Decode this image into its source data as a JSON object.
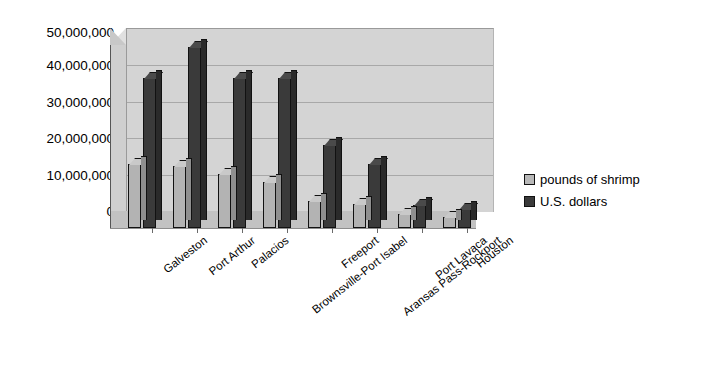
{
  "chart_data": {
    "type": "bar",
    "title": "",
    "subtitle": "",
    "xlabel": "",
    "ylabel": "",
    "ylim": [
      0,
      50000000
    ],
    "ytick_labels": [
      "50,000,000",
      "40,000,000",
      "30,000,000",
      "20,000,000",
      "10,000,000",
      "0"
    ],
    "ytick_values": [
      50000000,
      40000000,
      30000000,
      20000000,
      10000000,
      0
    ],
    "grid": true,
    "legend_position": "right",
    "categories": [
      "Galveston",
      "Port Arthur",
      "Palacios",
      "Brownsville-Port Isabel",
      "Freeport",
      "Aransas Pass-Rockport",
      "Port Lavaca",
      "Houston"
    ],
    "series": [
      {
        "name": "pounds of shrimp",
        "color": "#b8b8b8",
        "values": [
          17500000,
          17000000,
          14800000,
          12700000,
          7300000,
          6500000,
          3700000,
          2900000
        ]
      },
      {
        "name": "U.S. dollars",
        "color": "#3a3a3a",
        "values": [
          41000000,
          49500000,
          41000000,
          41000000,
          22800000,
          17500000,
          6200000,
          5200000
        ]
      }
    ]
  },
  "legend": {
    "items": [
      {
        "label": "pounds of shrimp",
        "swatch": "light-gray-swatch-icon"
      },
      {
        "label": "U.S. dollars",
        "swatch": "dark-gray-swatch-icon"
      }
    ]
  }
}
